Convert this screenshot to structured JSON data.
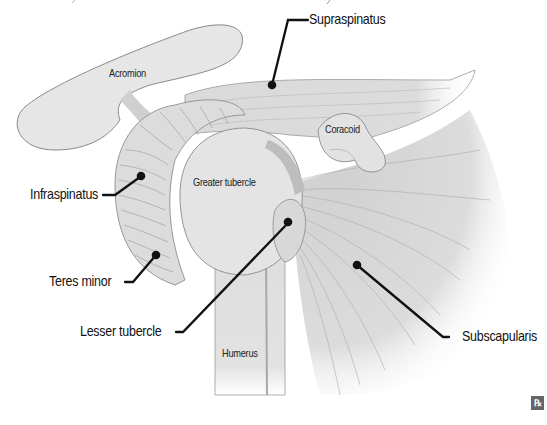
{
  "diagram": {
    "callout_labels": {
      "supraspinatus": "Supraspinatus",
      "infraspinatus": "Infraspinatus",
      "teres_minor": "Teres minor",
      "lesser_tubercle": "Lesser tubercle",
      "subscapularis": "Subscapularis"
    },
    "inline_labels": {
      "acromion": "Acromion",
      "coracoid": "Coracoid",
      "greater_tubercle": "Greater tubercle",
      "humerus": "Humerus"
    },
    "logo": {
      "text": "℞",
      "icon": "rx-icon"
    },
    "colors": {
      "background": "#ffffff",
      "bone_fill": "#e4e4e4",
      "muscle_fill": "#d6d6d6",
      "outline": "#8a8a8a",
      "leader_line": "#111111"
    }
  }
}
